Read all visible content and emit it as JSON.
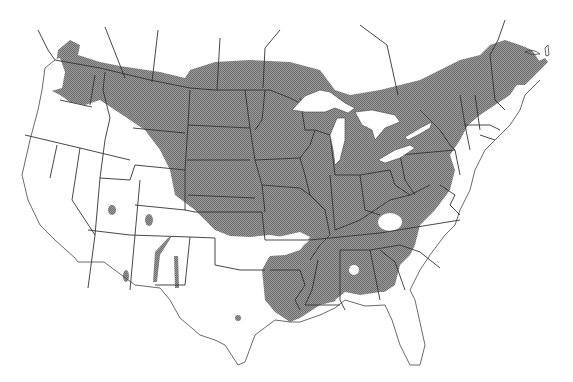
{
  "map": {
    "title": "",
    "subject": "Species distribution range map",
    "region": "United States and southern Canada",
    "legend": [],
    "colors": {
      "range_fill": "#8a8a8a",
      "border": "#333333",
      "background": "#ffffff"
    },
    "range_description": "Shaded range covers northern tier from Washington to Maine, Great Plains, Midwest, Northeast and Southeast, excluding Florida peninsula and Gulf coast; small isolated populations in Utah, Colorado, Arizona, New Mexico and central Texas"
  }
}
